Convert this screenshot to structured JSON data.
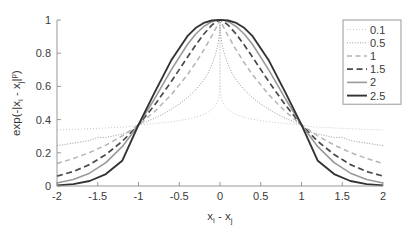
{
  "chart_data": {
    "type": "line",
    "title": "",
    "xlabel": "x_i - x_j",
    "xlabel_parts": {
      "base1": "x",
      "sub1": "i",
      "op": " - ",
      "base2": "x",
      "sub2": "j"
    },
    "ylabel": "exp(-|x_i - x_j|^p)",
    "ylabel_parts": {
      "pre": "exp(-|x",
      "sub1": "i",
      "op": " - x",
      "sub2": "j",
      "post": "|",
      "sup": "p",
      "close": ")"
    },
    "xlim": [
      -2,
      2
    ],
    "ylim": [
      0,
      1
    ],
    "xticks": [
      -2,
      -1.5,
      -1,
      -0.5,
      0,
      0.5,
      1,
      1.5,
      2
    ],
    "xtick_labels": [
      "-2",
      "-1.5",
      "-1",
      "-0.5",
      "0",
      "0.5",
      "1",
      "1.5",
      "2"
    ],
    "yticks": [
      0,
      0.2,
      0.4,
      0.6,
      0.8,
      1
    ],
    "ytick_labels": [
      "0",
      "0.2",
      "0.4",
      "0.6",
      "0.8",
      "1"
    ],
    "grid": false,
    "legend_position": "upper right",
    "function": "y = exp(-|x|^p)",
    "series": [
      {
        "name": "0.1",
        "p": 0.1,
        "color": "#c8c8c8",
        "width": 1.0,
        "dash": "1,2",
        "x": [
          -2,
          -1.9,
          -1.8,
          -1.7,
          -1.6,
          -1.5,
          -1.4,
          -1.3,
          -1.2,
          -1.1,
          -1,
          -0.9,
          -0.8,
          -0.7,
          -0.6,
          -0.5,
          -0.4,
          -0.3,
          -0.2,
          -0.15,
          -0.1,
          -0.06,
          -0.03,
          -0.012,
          -0.004,
          -0.0008,
          0,
          0.0008,
          0.004,
          0.012,
          0.03,
          0.06,
          0.1,
          0.15,
          0.2,
          0.3,
          0.4,
          0.5,
          0.6,
          0.7,
          0.8,
          0.9,
          1,
          1.1,
          1.2,
          1.3,
          1.4,
          1.5,
          1.6,
          1.7,
          1.8,
          1.9,
          2
        ],
        "y": [
          0.3376,
          0.3393,
          0.3411,
          0.343,
          0.3451,
          0.3472,
          0.3495,
          0.352,
          0.3547,
          0.3577,
          0.3679,
          0.3716,
          0.3759,
          0.3808,
          0.3866,
          0.3935,
          0.4022,
          0.4137,
          0.4307,
          0.4433,
          0.4616,
          0.4818,
          0.5063,
          0.5352,
          0.5726,
          0.6415,
          1.0,
          0.6415,
          0.5726,
          0.5352,
          0.5063,
          0.4818,
          0.4616,
          0.4433,
          0.4307,
          0.4137,
          0.4022,
          0.3935,
          0.3866,
          0.3808,
          0.3759,
          0.3716,
          0.3679,
          0.3577,
          0.3547,
          0.352,
          0.3495,
          0.3472,
          0.3451,
          0.343,
          0.3411,
          0.3393,
          0.3376
        ]
      },
      {
        "name": "0.5",
        "p": 0.5,
        "color": "#9a9a9a",
        "width": 1.0,
        "dash": "1,1.6",
        "x": [
          -2,
          -1.9,
          -1.8,
          -1.7,
          -1.6,
          -1.5,
          -1.4,
          -1.3,
          -1.2,
          -1.1,
          -1,
          -0.9,
          -0.8,
          -0.7,
          -0.6,
          -0.5,
          -0.4,
          -0.3,
          -0.2,
          -0.15,
          -0.1,
          -0.06,
          -0.03,
          -0.012,
          -0.004,
          -0.0008,
          0,
          0.0008,
          0.004,
          0.012,
          0.03,
          0.06,
          0.1,
          0.15,
          0.2,
          0.3,
          0.4,
          0.5,
          0.6,
          0.7,
          0.8,
          0.9,
          1,
          1.1,
          1.2,
          1.3,
          1.4,
          1.5,
          1.6,
          1.7,
          1.8,
          1.9,
          2
        ],
        "y": [
          0.2431,
          0.2504,
          0.258,
          0.2659,
          0.2743,
          0.2932,
          0.2926,
          0.3026,
          0.3132,
          0.3247,
          0.3679,
          0.3875,
          0.4091,
          0.4337,
          0.4621,
          0.4936,
          0.5314,
          0.578,
          0.6387,
          0.6774,
          0.7288,
          0.784,
          0.8412,
          0.8963,
          0.9393,
          0.9724,
          1.0,
          0.9724,
          0.9393,
          0.8963,
          0.8412,
          0.784,
          0.7288,
          0.6774,
          0.6387,
          0.578,
          0.5314,
          0.4936,
          0.4621,
          0.4337,
          0.4091,
          0.3875,
          0.3679,
          0.3247,
          0.3132,
          0.3026,
          0.2926,
          0.2932,
          0.2743,
          0.2659,
          0.258,
          0.2504,
          0.2431
        ]
      },
      {
        "name": "1",
        "p": 1,
        "color": "#b4b4b4",
        "width": 1.5,
        "dash": "5,3.5",
        "x": [
          -2,
          -1.8,
          -1.6,
          -1.4,
          -1.2,
          -1,
          -0.8,
          -0.6,
          -0.4,
          -0.3,
          -0.2,
          -0.1,
          -0.05,
          0,
          0.05,
          0.1,
          0.2,
          0.3,
          0.4,
          0.6,
          0.8,
          1,
          1.2,
          1.4,
          1.6,
          1.8,
          2
        ],
        "y": [
          0.1353,
          0.1653,
          0.2019,
          0.2466,
          0.3012,
          0.3679,
          0.4493,
          0.5488,
          0.6703,
          0.7408,
          0.8187,
          0.9048,
          0.9512,
          1.0,
          0.9512,
          0.9048,
          0.8187,
          0.7408,
          0.6703,
          0.5488,
          0.4493,
          0.3679,
          0.3012,
          0.2466,
          0.2019,
          0.1653,
          0.1353
        ]
      },
      {
        "name": "1.5",
        "p": 1.5,
        "color": "#4a4a4a",
        "width": 1.7,
        "dash": "6,3.5",
        "x": [
          -2,
          -1.8,
          -1.6,
          -1.4,
          -1.2,
          -1,
          -0.8,
          -0.6,
          -0.4,
          -0.3,
          -0.2,
          -0.1,
          -0.05,
          0,
          0.05,
          0.1,
          0.2,
          0.3,
          0.4,
          0.6,
          0.8,
          1,
          1.2,
          1.4,
          1.6,
          1.8,
          2
        ],
        "y": [
          0.0595,
          0.0872,
          0.1289,
          0.1899,
          0.2688,
          0.3679,
          0.4891,
          0.6276,
          0.7756,
          0.8478,
          0.9143,
          0.9691,
          0.9889,
          1.0,
          0.9889,
          0.9691,
          0.9143,
          0.8478,
          0.7756,
          0.6276,
          0.4891,
          0.3679,
          0.2688,
          0.1899,
          0.1289,
          0.0872,
          0.0595
        ]
      },
      {
        "name": "2",
        "p": 2,
        "color": "#999999",
        "width": 1.6,
        "dash": "none",
        "x": [
          -2,
          -1.8,
          -1.6,
          -1.4,
          -1.2,
          -1,
          -0.8,
          -0.6,
          -0.4,
          -0.3,
          -0.2,
          -0.1,
          -0.05,
          0,
          0.05,
          0.1,
          0.2,
          0.3,
          0.4,
          0.6,
          0.8,
          1,
          1.2,
          1.4,
          1.6,
          1.8,
          2
        ],
        "y": [
          0.0183,
          0.0392,
          0.0773,
          0.1409,
          0.2369,
          0.3679,
          0.5273,
          0.6977,
          0.8521,
          0.9139,
          0.9608,
          0.99,
          0.9975,
          1.0,
          0.9975,
          0.99,
          0.9608,
          0.9139,
          0.8521,
          0.6977,
          0.5273,
          0.3679,
          0.2369,
          0.1409,
          0.0773,
          0.0392,
          0.0183
        ]
      },
      {
        "name": "2.5",
        "p": 2.5,
        "color": "#333333",
        "width": 1.9,
        "dash": "none",
        "x": [
          -2,
          -1.8,
          -1.6,
          -1.4,
          -1.2,
          -1,
          -0.8,
          -0.6,
          -0.4,
          -0.3,
          -0.2,
          -0.1,
          -0.05,
          0,
          0.05,
          0.1,
          0.2,
          0.3,
          0.4,
          0.6,
          0.8,
          1,
          1.2,
          1.4,
          1.6,
          1.8,
          2
        ],
        "y": [
          0.0038,
          0.0113,
          0.0301,
          0.0718,
          0.1517,
          0.3679,
          0.5657,
          0.7556,
          0.9025,
          0.9515,
          0.9823,
          0.9968,
          0.9994,
          1.0,
          0.9994,
          0.9968,
          0.9823,
          0.9515,
          0.9025,
          0.7556,
          0.5657,
          0.3679,
          0.1517,
          0.0718,
          0.0301,
          0.0113,
          0.0038
        ]
      }
    ]
  }
}
